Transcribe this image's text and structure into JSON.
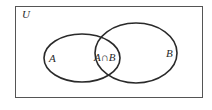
{
  "diagram": {
    "type": "venn",
    "universe_label": "U",
    "sets": [
      {
        "id": "A",
        "label": "A"
      },
      {
        "id": "B",
        "label": "B"
      }
    ],
    "intersection_label": "A∩B",
    "colors": {
      "stroke": "#2a2a2a",
      "background": "#ffffff",
      "frame": "#555555"
    }
  }
}
